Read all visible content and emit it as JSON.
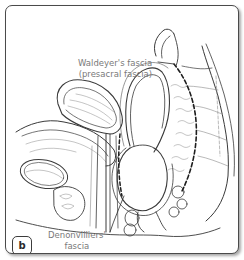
{
  "figure": {
    "panel_label": "b",
    "colors": {
      "line_art": "#3a3a3a",
      "hatch": "#8a8a8a",
      "label_text": "#7a7a7a",
      "frame_border": "#4a4a4a",
      "background": "#ffffff"
    }
  },
  "labels": {
    "waldeyer": {
      "line1": "Waldeyer's fascia",
      "line2": "(presacral fascia)"
    },
    "denonvilliers": {
      "line1": "Denonvilliers'",
      "line2": "fascia"
    }
  }
}
